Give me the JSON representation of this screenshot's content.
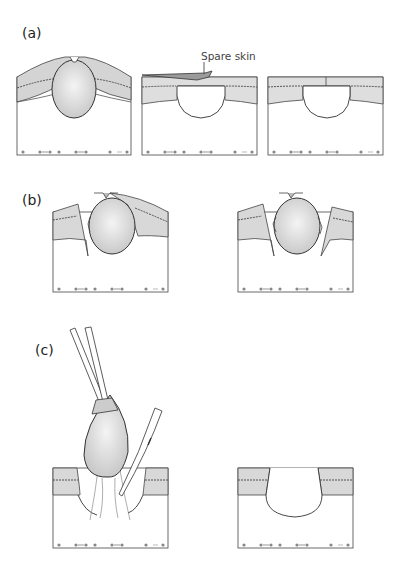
{
  "figure": {
    "panels": [
      {
        "id": "a",
        "label": "(a)",
        "annotations": [
          "Spare skin"
        ],
        "subpanels": 3
      },
      {
        "id": "b",
        "label": "(b)",
        "subpanels": 2
      },
      {
        "id": "c",
        "label": "(c)",
        "subpanels": 2
      }
    ],
    "colors": {
      "skin_dark": "#b9b9b9",
      "skin_light": "#e2e2e2",
      "cyst": "#d6d6d6",
      "outline": "#333333",
      "background": "#ffffff"
    },
    "caption": ""
  }
}
